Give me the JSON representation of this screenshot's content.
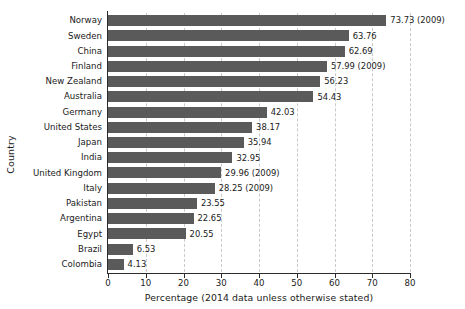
{
  "chart_data": {
    "type": "bar",
    "orientation": "horizontal",
    "title": "",
    "xlabel": "Percentage (2014 data unless otherwise stated)",
    "ylabel": "Country",
    "xlim": [
      0,
      80
    ],
    "xticks": [
      0,
      10,
      20,
      30,
      40,
      50,
      60,
      70,
      80
    ],
    "xtick_labels": [
      "0",
      "10",
      "20",
      "30",
      "40",
      "50",
      "60",
      "70",
      "80"
    ],
    "grid": "vertical-dashed",
    "legend": "none",
    "bar_color": "#5a5a5a",
    "categories": [
      "Norway",
      "Sweden",
      "China",
      "Finland",
      "New Zealand",
      "Australia",
      "Germany",
      "United States",
      "Japan",
      "India",
      "United Kingdom",
      "Italy",
      "Pakistan",
      "Argentina",
      "Egypt",
      "Brazil",
      "Colombia"
    ],
    "values": [
      73.73,
      63.76,
      62.69,
      57.99,
      56.23,
      54.43,
      42.03,
      38.17,
      35.94,
      32.95,
      29.96,
      28.25,
      23.55,
      22.65,
      20.55,
      6.53,
      4.13
    ],
    "data_labels": [
      "73.73 (2009)",
      "63.76",
      "62.69",
      "57.99 (2009)",
      "56.23",
      "54.43",
      "42.03",
      "38.17",
      "35.94",
      "32.95",
      "29.96 (2009)",
      "28.25 (2009)",
      "23.55",
      "22.65",
      "20.55",
      "6.53",
      "4.13"
    ]
  }
}
